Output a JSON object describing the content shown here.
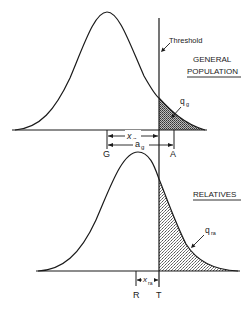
{
  "diagram": {
    "threshold_label": "Threshold",
    "top_panel": {
      "title_line1": "GENERAL",
      "title_line2": "POPULATION",
      "area_label": "q",
      "area_sub": "g",
      "mean_label": "G",
      "affected_mean_label": "A",
      "distance1_label": "x",
      "distance1_sub": "g",
      "distance2_label": "a",
      "distance2_sub": "g"
    },
    "bottom_panel": {
      "title": "RELATIVES",
      "area_label": "q",
      "area_sub": "ra",
      "mean_label": "R",
      "threshold_point_label": "T",
      "distance_label": "x",
      "distance_sub": "ra"
    },
    "colors": {
      "ink": "#1a1a1a",
      "shade": "#9a9a9a"
    }
  }
}
